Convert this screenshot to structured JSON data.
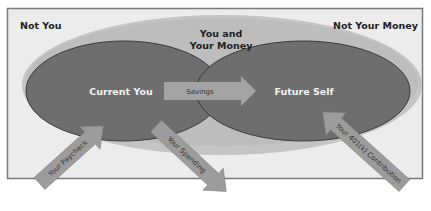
{
  "diagram": {
    "regions": {
      "outer_left": "Not You",
      "outer_right": "Not Your Money",
      "middle_line1": "You and",
      "middle_line2": "Your Money",
      "current_you": "Current You",
      "future_self": "Future Self"
    },
    "arrows": {
      "savings": "Savings",
      "paycheck": "Your Paycheck",
      "spending": "Your Spending",
      "contribution": "Your 401(k) Contribution"
    },
    "colors": {
      "background_box": "#ececec",
      "box_border": "#7a7a7a",
      "middle_ellipse": "#bfbfbf",
      "inner_ellipses": "#6e6e6e",
      "inner_ellipse_stroke": "#3a3a3a",
      "arrow_fill": "#9c9c9c",
      "arrow_text": "#333333",
      "inner_text": "#f2f2f2",
      "outer_text": "#222222"
    }
  }
}
